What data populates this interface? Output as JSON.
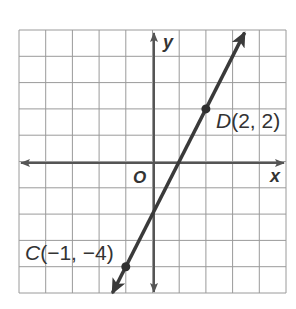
{
  "chart_data": {
    "type": "line",
    "title": "",
    "xlabel": "x",
    "ylabel": "y",
    "origin_label": "O",
    "xlim": [
      -5,
      5
    ],
    "ylim": [
      -5,
      5
    ],
    "grid": true,
    "grid_step": 1,
    "points": [
      {
        "name": "C",
        "x": -1,
        "y": -4,
        "label": "C(−1, −4)"
      },
      {
        "name": "D",
        "x": 2,
        "y": 2,
        "label": "D(2, 2)"
      }
    ],
    "line": {
      "through": [
        "C",
        "D"
      ],
      "slope": 2,
      "intercept": -2,
      "x_range": [
        -1.5,
        3.45
      ],
      "arrows": "both"
    }
  },
  "labels": {
    "x_axis": "x",
    "y_axis": "y",
    "origin": "O",
    "point_c_name": "C",
    "point_c_coords": "(−1, −4)",
    "point_d_name": "D",
    "point_d_coords": "(2, 2)"
  },
  "colors": {
    "grid": "#9a9a9a",
    "axis": "#555555",
    "line": "#3a3a3a",
    "text": "#333333",
    "background": "#ffffff"
  }
}
